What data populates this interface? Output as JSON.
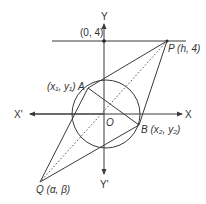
{
  "diagram": {
    "type": "geometry",
    "colors": {
      "line": "#3a3a3a",
      "background": "#ffffff"
    },
    "axes": {
      "y_label": "Y",
      "y_neg_label": "Y'",
      "x_label": "X",
      "x_neg_label": "X'",
      "origin_label": "O"
    },
    "points": {
      "p0_4": {
        "label": "(0, 4)"
      },
      "P": {
        "label": "P (h, 4)"
      },
      "A": {
        "label": "(x₁, y₁) A"
      },
      "B": {
        "label": "B (x₂, y₂)"
      },
      "Q": {
        "label": "Q (α, β)"
      }
    }
  }
}
